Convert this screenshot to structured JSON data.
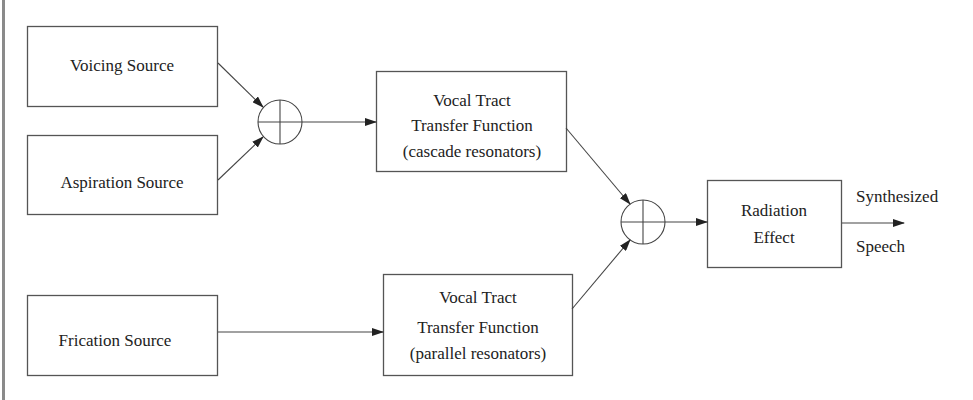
{
  "diagram": {
    "title": "",
    "nodes": {
      "voicing": {
        "label": "Voicing Source"
      },
      "aspiration": {
        "label": "Aspiration Source"
      },
      "frication": {
        "label": "Frication Source"
      },
      "cascade": {
        "lines": [
          "Vocal Tract",
          "Transfer Function",
          "(cascade resonators)"
        ]
      },
      "parallel": {
        "lines": [
          "Vocal Tract",
          "Transfer Function",
          "(parallel resonators)"
        ]
      },
      "radiation": {
        "lines": [
          "Radiation",
          "Effect"
        ]
      },
      "sum1": {
        "symbol": "summing-junction"
      },
      "sum2": {
        "symbol": "summing-junction"
      }
    },
    "output": {
      "lines": [
        "Synthesized",
        "Speech"
      ]
    },
    "edges": [
      {
        "from": "voicing",
        "to": "sum1"
      },
      {
        "from": "aspiration",
        "to": "sum1"
      },
      {
        "from": "sum1",
        "to": "cascade"
      },
      {
        "from": "cascade",
        "to": "sum2"
      },
      {
        "from": "frication",
        "to": "parallel"
      },
      {
        "from": "parallel",
        "to": "sum2"
      },
      {
        "from": "sum2",
        "to": "radiation"
      },
      {
        "from": "radiation",
        "to": "output"
      }
    ]
  }
}
